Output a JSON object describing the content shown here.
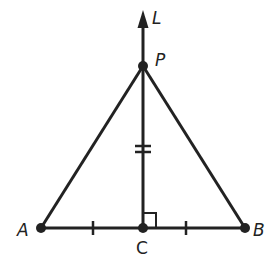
{
  "diagram": {
    "type": "perpendicular bisector of a segment",
    "colors": {
      "stroke": "#222222",
      "background": "#ffffff"
    },
    "points": {
      "A": {
        "label": "A",
        "x": 41,
        "y": 228
      },
      "B": {
        "label": "B",
        "x": 245,
        "y": 228
      },
      "C": {
        "label": "C",
        "x": 143,
        "y": 228
      },
      "P": {
        "label": "P",
        "x": 143,
        "y": 66
      }
    },
    "line": {
      "label": "L",
      "from": [
        143,
        228
      ],
      "to": [
        143,
        12
      ],
      "arrow": "up"
    },
    "segments": [
      {
        "name": "AB",
        "from": "A",
        "to": "B"
      },
      {
        "name": "PA",
        "from": "P",
        "to": "A"
      },
      {
        "name": "PB",
        "from": "P",
        "to": "B"
      },
      {
        "name": "PC",
        "from": "P",
        "to": "C"
      }
    ],
    "marks": {
      "AC_tick": "single tick",
      "CB_tick": "single tick",
      "PC_tick": "double tick",
      "right_angle_at": "C"
    }
  }
}
